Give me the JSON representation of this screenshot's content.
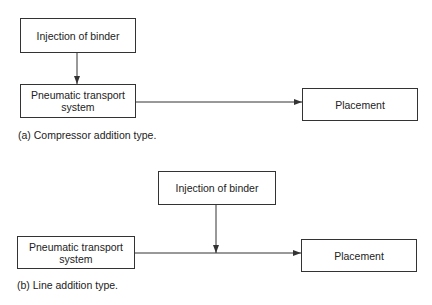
{
  "diagrams": [
    {
      "caption": "(a) Compressor addition type.",
      "injection": "Injection of binder",
      "transport": "Pneumatic transport system",
      "placement": "Placement"
    },
    {
      "caption": "(b) Line addition type.",
      "injection": "Injection of binder",
      "transport": "Pneumatic transport system",
      "placement": "Placement"
    }
  ],
  "colors": {
    "line": "#333333",
    "text": "#222222"
  }
}
